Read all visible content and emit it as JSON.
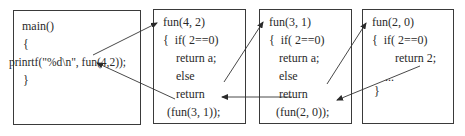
{
  "boxes": [
    {
      "id": "main",
      "lines": [
        "main()",
        "{",
        "prinrtf(\"%d\\n\", fun(4,2));",
        "}"
      ]
    },
    {
      "id": "fun42",
      "lines": [
        "fun(4, 2)",
        "{  if( 2==0)",
        "return a;",
        "else",
        "return",
        "(fun(3, 1));"
      ]
    },
    {
      "id": "fun31",
      "lines": [
        "fun(3, 1)",
        "{  if( 2==0)",
        "return a;",
        "else",
        "return",
        "(fun(2, 0));"
      ]
    },
    {
      "id": "fun20",
      "lines": [
        "fun(2, 0)",
        "{  if( 2==0)",
        "return 2;",
        "...",
        "}"
      ]
    }
  ],
  "arrows": [
    {
      "from": "main.call",
      "to": "fun42.header",
      "kind": "call"
    },
    {
      "from": "fun42.return",
      "to": "main.call",
      "kind": "return"
    },
    {
      "from": "fun42.call",
      "to": "fun31.header",
      "kind": "call"
    },
    {
      "from": "fun31.return",
      "to": "fun42.call",
      "kind": "return"
    },
    {
      "from": "fun31.call",
      "to": "fun20.header",
      "kind": "call"
    },
    {
      "from": "fun20.return",
      "to": "fun31.call",
      "kind": "return"
    }
  ]
}
